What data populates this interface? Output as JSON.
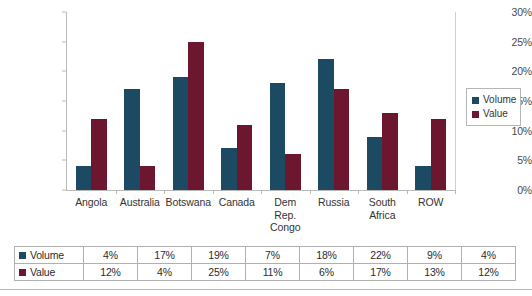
{
  "chart_data": {
    "type": "bar",
    "title": "",
    "subtitle": "",
    "xlabel": "",
    "ylabel": "",
    "ylim": [
      0,
      30
    ],
    "y_tick_step": 5,
    "y_tick_labels": [
      "0%",
      "5%",
      "10%",
      "15%",
      "20%",
      "25%",
      "30%"
    ],
    "y_tick_values": [
      0,
      5,
      10,
      15,
      20,
      25,
      30
    ],
    "grid": false,
    "legend_position": "right",
    "value_suffix": "%",
    "categories": [
      "Angola",
      "Australia",
      "Botswana",
      "Canada",
      "Dem Rep. Congo",
      "Russia",
      "South Africa",
      "ROW"
    ],
    "category_label_lines": [
      [
        "Angola"
      ],
      [
        "Australia"
      ],
      [
        "Botswana"
      ],
      [
        "Canada"
      ],
      [
        "Dem",
        "Rep.",
        "Congo"
      ],
      [
        "Russia"
      ],
      [
        "South",
        "Africa"
      ],
      [
        "ROW"
      ]
    ],
    "series": [
      {
        "name": "Volume",
        "color": "#1c4a62",
        "values": [
          4,
          17,
          19,
          7,
          18,
          22,
          9,
          4
        ],
        "labels": [
          "4%",
          "17%",
          "19%",
          "7%",
          "18%",
          "22%",
          "9%",
          "4%"
        ]
      },
      {
        "name": "Value",
        "color": "#6d1630",
        "values": [
          12,
          4,
          25,
          11,
          6,
          17,
          13,
          12
        ],
        "labels": [
          "12%",
          "4%",
          "25%",
          "11%",
          "6%",
          "17%",
          "13%",
          "12%"
        ]
      }
    ]
  },
  "legend": {
    "items": [
      {
        "label": "Volume",
        "color": "#1c4a62"
      },
      {
        "label": "Value",
        "color": "#6d1630"
      }
    ]
  },
  "table": {
    "rows": [
      {
        "label": "Volume",
        "color": "#1c4a62",
        "cells": [
          "4%",
          "17%",
          "19%",
          "7%",
          "18%",
          "22%",
          "9%",
          "4%"
        ]
      },
      {
        "label": "Value",
        "color": "#6d1630",
        "cells": [
          "12%",
          "4%",
          "25%",
          "11%",
          "6%",
          "17%",
          "13%",
          "12%"
        ]
      }
    ]
  }
}
